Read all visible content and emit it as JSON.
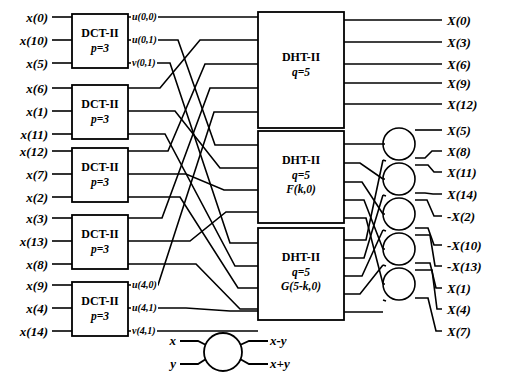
{
  "figure": {
    "type": "signal-flow-diagram"
  },
  "inputs": [
    {
      "label": "x(0)",
      "x": 48,
      "y": 17
    },
    {
      "label": "x(10)",
      "x": 48,
      "y": 40
    },
    {
      "label": "x(5)",
      "x": 48,
      "y": 63
    },
    {
      "label": "x(6)",
      "x": 48,
      "y": 88
    },
    {
      "label": "x(1)",
      "x": 48,
      "y": 111
    },
    {
      "label": "x(11)",
      "x": 48,
      "y": 134
    },
    {
      "label": "x(12)",
      "x": 48,
      "y": 151
    },
    {
      "label": "x(7)",
      "x": 48,
      "y": 174
    },
    {
      "label": "x(2)",
      "x": 48,
      "y": 197
    },
    {
      "label": "x(3)",
      "x": 48,
      "y": 218
    },
    {
      "label": "x(13)",
      "x": 48,
      "y": 241
    },
    {
      "label": "x(8)",
      "x": 48,
      "y": 264
    },
    {
      "label": "x(9)",
      "x": 48,
      "y": 285
    },
    {
      "label": "x(4)",
      "x": 48,
      "y": 308
    },
    {
      "label": "x(14)",
      "x": 48,
      "y": 331
    }
  ],
  "dct_blocks": [
    {
      "name": "DCT-II",
      "param": "p=3",
      "x": 72,
      "y": 14,
      "w": 56,
      "h": 54
    },
    {
      "name": "DCT-II",
      "param": "p=3",
      "x": 72,
      "y": 85,
      "w": 56,
      "h": 54
    },
    {
      "name": "DCT-II",
      "param": "p=3",
      "x": 72,
      "y": 148,
      "w": 56,
      "h": 54
    },
    {
      "name": "DCT-II",
      "param": "p=3",
      "x": 72,
      "y": 215,
      "w": 56,
      "h": 54
    },
    {
      "name": "DCT-II",
      "param": "p=3",
      "x": 72,
      "y": 282,
      "w": 56,
      "h": 54
    }
  ],
  "intermediate_labels": [
    {
      "label": "u(0,0)",
      "x": 131,
      "y": 17
    },
    {
      "label": "u(0,1)",
      "x": 131,
      "y": 40
    },
    {
      "label": "v(0,1)",
      "x": 131,
      "y": 63
    },
    {
      "label": "u(4,0)",
      "x": 131,
      "y": 285
    },
    {
      "label": "u(4,1)",
      "x": 131,
      "y": 308
    },
    {
      "label": "v(4,1)",
      "x": 131,
      "y": 331
    }
  ],
  "dht_blocks": [
    {
      "name": "DHT-II",
      "param": "q=5",
      "extra": "",
      "x": 258,
      "y": 12,
      "w": 86,
      "h": 116
    },
    {
      "name": "DHT-II",
      "param": "q=5",
      "extra": "F(k,0)",
      "x": 258,
      "y": 131,
      "w": 86,
      "h": 92
    },
    {
      "name": "DHT-II",
      "param": "q=5",
      "extra": "G(5-k,0)",
      "x": 258,
      "y": 228,
      "w": 86,
      "h": 92
    }
  ],
  "butterflies": [
    {
      "cx": 399,
      "cy": 144,
      "r": 16
    },
    {
      "cx": 399,
      "cy": 179,
      "r": 16
    },
    {
      "cx": 399,
      "cy": 214,
      "r": 16
    },
    {
      "cx": 399,
      "cy": 249,
      "r": 16
    },
    {
      "cx": 399,
      "cy": 284,
      "r": 16
    }
  ],
  "outputs": [
    {
      "label": "X(0)",
      "x": 447,
      "y": 20
    },
    {
      "label": "X(3)",
      "x": 447,
      "y": 42
    },
    {
      "label": "X(6)",
      "x": 447,
      "y": 64
    },
    {
      "label": "X(9)",
      "x": 447,
      "y": 83
    },
    {
      "label": "X(12)",
      "x": 447,
      "y": 104
    },
    {
      "label": "X(5)",
      "x": 447,
      "y": 130
    },
    {
      "label": "X(8)",
      "x": 447,
      "y": 151
    },
    {
      "label": "X(11)",
      "x": 447,
      "y": 172
    },
    {
      "label": "X(14)",
      "x": 447,
      "y": 194
    },
    {
      "label": "-X(2)",
      "x": 447,
      "y": 216
    },
    {
      "label": "-X(10)",
      "x": 447,
      "y": 245
    },
    {
      "label": "-X(13)",
      "x": 447,
      "y": 266
    },
    {
      "label": "X(1)",
      "x": 447,
      "y": 288
    },
    {
      "label": "X(4)",
      "x": 447,
      "y": 309
    },
    {
      "label": "X(7)",
      "x": 447,
      "y": 331
    }
  ],
  "legend": {
    "input_top": "x",
    "input_bottom": "y",
    "output_top": "x-y",
    "output_bottom": "x+y",
    "circle": {
      "cx": 223,
      "cy": 352,
      "r": 19
    }
  },
  "style": {
    "line_color": "#000000",
    "box_fill": "#ffffff",
    "background": "#ffffff"
  }
}
